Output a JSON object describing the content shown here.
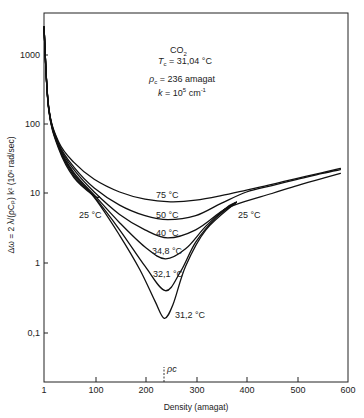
{
  "chart_data": {
    "type": "line",
    "title": "",
    "xlabel": "Density (amagat)",
    "ylabel": "Δω = 2 λ/(ρC_p) k² (10⁶ rad/sec)",
    "x_scale": "linear",
    "y_scale": "log",
    "xlim": [
      1,
      600
    ],
    "ylim": [
      0.02,
      4000
    ],
    "x_ticks": [
      1,
      100,
      200,
      300,
      400,
      500,
      600
    ],
    "x_tick_labels": [
      "1",
      "100",
      "200",
      "300",
      "400",
      "500",
      "600"
    ],
    "y_ticks": [
      1000,
      100,
      10,
      1,
      0.1
    ],
    "y_tick_labels": [
      "1000",
      "100",
      "10",
      "1",
      "0,1"
    ],
    "grid": false,
    "legend": "none (curves labeled inline)",
    "annotations": {
      "substance": "CO₂",
      "tc": "T_c = 31,04 °C",
      "rhoc": "ρ_c = 236 amagat",
      "k": "k = 10⁵ cm⁻¹",
      "rhoc_marker_label": "ρc",
      "rhoc_marker_x": 236
    },
    "series": [
      {
        "name": "75 °C",
        "x": [
          1,
          10,
          30,
          60,
          100,
          150,
          200,
          250,
          300,
          350,
          400,
          450,
          500,
          550,
          585
        ],
        "values": [
          2500,
          180,
          55,
          28,
          16,
          10.5,
          8.3,
          7.6,
          8.0,
          9.3,
          11.2,
          13.5,
          16.5,
          20,
          23
        ]
      },
      {
        "name": "50 °C",
        "x": [
          1,
          10,
          30,
          60,
          100,
          150,
          200,
          245,
          300,
          350,
          400,
          450,
          500,
          550,
          585
        ],
        "values": [
          2500,
          180,
          52,
          24,
          12,
          6.8,
          4.8,
          4.2,
          4.8,
          7.2,
          10.5,
          13,
          16,
          19.5,
          22
        ]
      },
      {
        "name": "40 °C",
        "x": [
          1,
          10,
          30,
          60,
          100,
          150,
          200,
          245,
          300,
          350,
          380
        ],
        "values": [
          2500,
          175,
          50,
          22,
          10.5,
          5.0,
          3.0,
          2.3,
          3.0,
          5.5,
          7.5
        ]
      },
      {
        "name": "34.8 °C",
        "x": [
          1,
          10,
          30,
          60,
          100,
          150,
          200,
          240,
          280,
          320,
          360,
          380
        ],
        "values": [
          2500,
          175,
          48,
          20,
          9.5,
          3.8,
          1.7,
          1.15,
          1.6,
          3.4,
          6.2,
          7.5
        ]
      },
      {
        "name": "32.1 °C",
        "x": [
          1,
          10,
          30,
          60,
          100,
          150,
          200,
          240,
          270,
          300,
          340,
          380
        ],
        "values": [
          2500,
          170,
          47,
          19,
          9.0,
          3.0,
          0.9,
          0.4,
          0.75,
          2.0,
          4.5,
          7.5
        ]
      },
      {
        "name": "31.2 °C",
        "x": [
          1,
          10,
          30,
          60,
          100,
          150,
          190,
          220,
          238,
          255,
          280,
          320,
          380
        ],
        "values": [
          2500,
          170,
          46,
          18,
          8.8,
          2.5,
          0.8,
          0.28,
          0.16,
          0.25,
          0.9,
          3.0,
          7.5
        ]
      },
      {
        "name": "25 °C (gas branch)",
        "x": [
          1,
          10,
          30,
          60,
          100,
          110
        ],
        "values": [
          2500,
          165,
          44,
          17,
          9.2,
          9.0
        ]
      },
      {
        "name": "25 °C (liquid branch)",
        "x": [
          355,
          380,
          450,
          500,
          550,
          585
        ],
        "values": [
          5.8,
          7.0,
          10,
          13,
          16.5,
          19.5
        ]
      }
    ],
    "curve_labels": [
      {
        "text": "75 °C",
        "x": 250,
        "y": 9.8
      },
      {
        "text": "50 °C",
        "x": 250,
        "y": 5.2
      },
      {
        "text": "40 °C",
        "x": 245,
        "y": 2.8
      },
      {
        "text": "34,8 °C",
        "x": 240,
        "y": 1.45
      },
      {
        "text": "32,1 °C",
        "x": 240,
        "y": 0.6
      },
      {
        "text": "31,2 °C",
        "x": 285,
        "y": 0.18
      },
      {
        "text": "25 °C",
        "x": 70,
        "y": 5.0
      },
      {
        "text": "25 °C",
        "x": 420,
        "y": 5.0
      }
    ]
  },
  "labels": {
    "substance": "CO",
    "substance_sub": "2",
    "tc_sym": "T",
    "tc_sub": "c",
    "tc_val": " = 31,04 °C",
    "rhoc_sym": "ρ",
    "rhoc_sub": "c",
    "rhoc_val": " = 236  amagat",
    "k_sym": "k",
    "k_val": " = 10",
    "k_exp": "5",
    "k_unit": "  cm",
    "k_unit_exp": "-1",
    "xlabel": "Density (amagat)",
    "ylabel": "Δω = 2 λ/(ρCₚ) k² (10⁶ rad/sec)",
    "rhoc_marker": "ρc",
    "curve_75": "75 °C",
    "curve_50": "50 °C",
    "curve_40": "40 °C",
    "curve_348": "34,8 °C",
    "curve_321": "32,1 °C",
    "curve_312": "31,2 °C",
    "curve_25_left": "25 °C",
    "curve_25_right": "25 °C",
    "xt0": "1",
    "xt1": "100",
    "xt2": "200",
    "xt3": "300",
    "xt4": "400",
    "xt5": "500",
    "xt6": "600",
    "yt0": "1000",
    "yt1": "100",
    "yt2": "10",
    "yt3": "1",
    "yt4": "0,1"
  },
  "colors": {
    "ink": "#111111",
    "background": "#ffffff"
  }
}
